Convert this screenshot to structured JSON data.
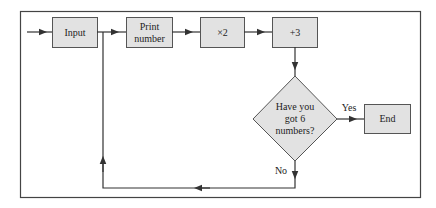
{
  "diagram": {
    "type": "flowchart",
    "colors": {
      "box_fill": "#e2e2e2",
      "box_stroke": "#555555",
      "line": "#333333",
      "frame": "#444444",
      "background": "#ffffff"
    },
    "nodes": [
      {
        "id": "input",
        "label": "Input",
        "shape": "rectangle"
      },
      {
        "id": "print",
        "label": "Print number",
        "label_lines": [
          "Print",
          "number"
        ],
        "shape": "rectangle"
      },
      {
        "id": "times2",
        "label": "×2",
        "shape": "rectangle"
      },
      {
        "id": "plus3",
        "label": "+3",
        "shape": "rectangle"
      },
      {
        "id": "decision",
        "label": "Have you got 6 numbers?",
        "label_lines": [
          "Have you",
          "got 6",
          "numbers?"
        ],
        "shape": "diamond"
      },
      {
        "id": "end",
        "label": "End",
        "shape": "rectangle"
      }
    ],
    "edges": [
      {
        "from": "start",
        "to": "input"
      },
      {
        "from": "input",
        "to": "print"
      },
      {
        "from": "print",
        "to": "times2"
      },
      {
        "from": "times2",
        "to": "plus3"
      },
      {
        "from": "plus3",
        "to": "decision"
      },
      {
        "from": "decision",
        "to": "end",
        "label": "Yes"
      },
      {
        "from": "decision",
        "to": "print",
        "label": "No"
      }
    ],
    "edge_labels": {
      "yes": "Yes",
      "no": "No"
    }
  }
}
